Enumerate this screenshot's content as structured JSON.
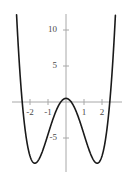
{
  "figure": {
    "background_color": "#ffffff",
    "curve_color": "#1a1a1a",
    "axis_color": "#a8a8a8",
    "label_color": "#4a4a4a"
  },
  "chart_data": {
    "type": "line",
    "title": "",
    "subtitle": "",
    "xlabel": "",
    "ylabel": "",
    "grid": false,
    "legend": "none",
    "function": "y = x^4 - 6x^2 + 0.5",
    "xlim": [
      -3.0,
      3.1
    ],
    "ylim": [
      -10.2,
      11.5
    ],
    "x_ticks": [
      -2,
      -1,
      1,
      2
    ],
    "x_tick_labels": [
      "-2",
      "-1",
      "1",
      "2"
    ],
    "y_ticks": [
      -5,
      5,
      10
    ],
    "y_tick_labels": [
      "-5",
      "5",
      "10"
    ],
    "annotations": [],
    "features": {
      "local_maximum": {
        "x": 0,
        "y": 0.5
      },
      "local_minima": [
        {
          "x": -1.73,
          "y": -8.5
        },
        {
          "x": 1.73,
          "y": -8.5
        }
      ]
    },
    "series": [
      {
        "name": "quartic",
        "x": [
          -3.0,
          -2.9,
          -2.8,
          -2.7,
          -2.6,
          -2.5,
          -2.4,
          -2.3,
          -2.2,
          -2.1,
          -2.0,
          -1.9,
          -1.8,
          -1.7,
          -1.6,
          -1.5,
          -1.4,
          -1.3,
          -1.2,
          -1.1,
          -1.0,
          -0.9,
          -0.8,
          -0.7,
          -0.6,
          -0.5,
          -0.4,
          -0.3,
          -0.2,
          -0.1,
          0.0,
          0.1,
          0.2,
          0.3,
          0.4,
          0.5,
          0.6,
          0.7,
          0.8,
          0.9,
          1.0,
          1.1,
          1.2,
          1.3,
          1.4,
          1.5,
          1.6,
          1.7,
          1.8,
          1.9,
          2.0,
          2.1,
          2.2,
          2.3,
          2.4,
          2.5,
          2.6,
          2.7,
          2.8,
          2.9,
          3.0
        ],
        "y": [
          27.5,
          20.22,
          14.22,
          10.36,
          5.44,
          1.56,
          -1.38,
          -3.48,
          -4.86,
          -6.06,
          -7.5,
          -8.63,
          -9.01,
          -9.17,
          -9.09,
          -8.69,
          -7.92,
          -6.73,
          -5.07,
          -2.89,
          -4.5,
          -4.2,
          -3.42,
          -2.46,
          -1.58,
          -0.94,
          -0.48,
          -0.02,
          0.26,
          0.44,
          0.5,
          0.44,
          0.26,
          -0.02,
          -0.48,
          -0.94,
          -1.58,
          -2.46,
          -3.42,
          -4.2,
          -4.5,
          -2.89,
          -5.07,
          -6.73,
          -7.92,
          -8.69,
          -9.09,
          -9.17,
          -9.01,
          -8.63,
          -7.5,
          -6.06,
          -4.86,
          -3.48,
          -1.38,
          1.56,
          5.44,
          10.36,
          14.22,
          20.22,
          27.5
        ]
      }
    ]
  },
  "axes": {
    "y_labels": [
      {
        "text": "10",
        "value": 10
      },
      {
        "text": "5",
        "value": 5
      },
      {
        "text": "-5",
        "value": -5
      }
    ],
    "x_labels": [
      {
        "text": "-2",
        "value": -2
      },
      {
        "text": "-1",
        "value": -1
      },
      {
        "text": "1",
        "value": 1
      },
      {
        "text": "2",
        "value": 2
      }
    ]
  }
}
